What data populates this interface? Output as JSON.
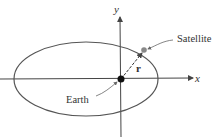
{
  "diagram": {
    "labels": {
      "x_axis": "x",
      "y_axis": "y",
      "satellite": "Satellite",
      "earth": "Earth",
      "position_vector": "r"
    },
    "colors": {
      "orbit": "#555555",
      "axes": "#444444",
      "earth": "#111111",
      "satellite": "#888888",
      "leader": "#666666"
    }
  }
}
